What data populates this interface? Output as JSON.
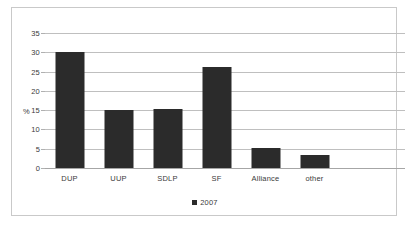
{
  "chart_data": {
    "type": "bar",
    "title": "",
    "subtitle": "",
    "xlabel": "",
    "ylabel": "%",
    "categories": [
      "DUP",
      "UUP",
      "SDLP",
      "SF",
      "Alliance",
      "other"
    ],
    "series": [
      {
        "name": "2007",
        "color": "#2b2b2b",
        "values": [
          30.1,
          15.0,
          15.3,
          26.2,
          5.3,
          3.3
        ]
      }
    ],
    "ylim": [
      0,
      35
    ],
    "ytick_values": [
      0,
      5,
      10,
      15,
      20,
      25,
      30,
      35
    ],
    "ytick_labels": [
      "0",
      "5",
      "10",
      "15",
      "20",
      "25",
      "30",
      "35"
    ],
    "grid": true,
    "grid_axis": "y",
    "legend": {
      "position": "bottom",
      "entries": [
        {
          "label": "2007",
          "marker": "square",
          "color": "#2b2b2b"
        }
      ]
    },
    "annotations": [],
    "frame": {
      "border_color": "#c9c9c9",
      "plot_background": "#ffffff",
      "gridline_color": "#bfbfbf",
      "axis_color": "#a6a6a6",
      "text_color": "#3a3a3a"
    }
  }
}
